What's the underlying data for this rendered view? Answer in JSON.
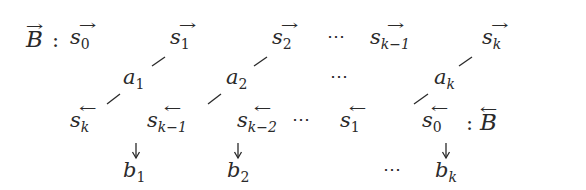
{
  "diagram": {
    "title_forward": {
      "symbol": "B",
      "arrow": "→",
      "colon": ":"
    },
    "title_backward": {
      "symbol": "B",
      "arrow": "←",
      "colon": ":"
    },
    "row_top": {
      "items": [
        {
          "base": "s",
          "sub": "0",
          "arrow": "→"
        },
        {
          "base": "s",
          "sub": "1",
          "arrow": "→"
        },
        {
          "base": "s",
          "sub": "2",
          "arrow": "→"
        },
        {
          "base": "s",
          "sub": "k−1",
          "arrow": "→"
        },
        {
          "base": "s",
          "sub": "k",
          "arrow": "→"
        }
      ],
      "ellipsis": "⋯"
    },
    "row_middle": {
      "items": [
        {
          "base": "a",
          "sub": "1"
        },
        {
          "base": "a",
          "sub": "2"
        },
        {
          "base": "a",
          "sub": "k"
        }
      ],
      "ellipsis": "⋯"
    },
    "row_bottom": {
      "items": [
        {
          "base": "s",
          "sub": "k",
          "arrow": "←"
        },
        {
          "base": "s",
          "sub": "k−1",
          "arrow": "←"
        },
        {
          "base": "s",
          "sub": "k−2",
          "arrow": "←"
        },
        {
          "base": "s",
          "sub": "1",
          "arrow": "←"
        },
        {
          "base": "s",
          "sub": "0",
          "arrow": "←"
        }
      ],
      "ellipsis": "⋯"
    },
    "row_outputs": {
      "items": [
        {
          "base": "b",
          "sub": "1"
        },
        {
          "base": "b",
          "sub": "2"
        },
        {
          "base": "b",
          "sub": "k"
        }
      ],
      "ellipsis": "⋯"
    },
    "colors": {
      "ink": "#2a2a2a",
      "background": "#ffffff"
    }
  }
}
